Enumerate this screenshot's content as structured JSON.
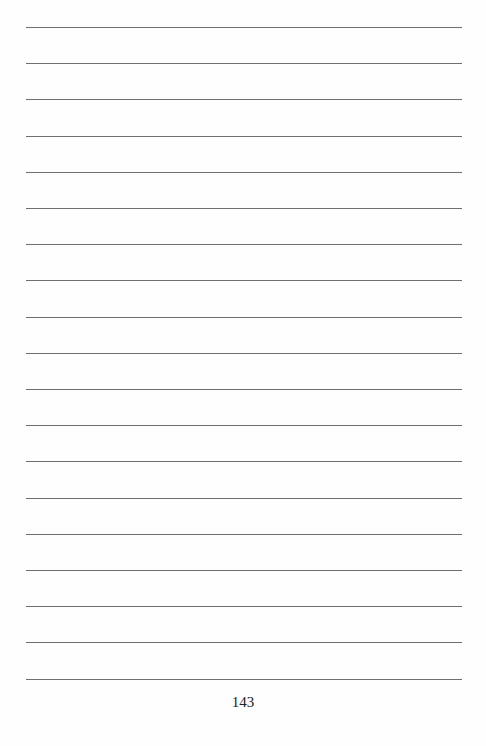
{
  "page": {
    "type": "lined-notebook-page",
    "line_count": 19,
    "line_color": "#6e6e6e",
    "page_number": "143"
  }
}
